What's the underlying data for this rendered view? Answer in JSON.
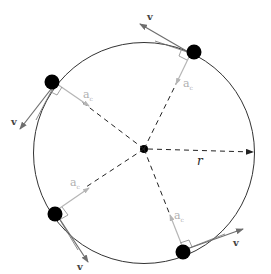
{
  "diagram": {
    "colors": {
      "circle": "#333333",
      "ball": "#000000",
      "velocity_arrow": "#6e6e6e",
      "acceleration_arrow": "#b5b5b5",
      "radius_dash": "#222222",
      "label_v": "#444444",
      "label_a": "#b0b0b0"
    },
    "center": {
      "x": 144,
      "y": 149
    },
    "radius": 110,
    "radius_label": "r",
    "velocity_label": "v",
    "acceleration_label": "a",
    "acceleration_subscript": "c",
    "objects": [
      {
        "id": "top-right",
        "velocity_label": "v",
        "acceleration_label": "a",
        "acceleration_subscript": "c"
      },
      {
        "id": "upper-left",
        "velocity_label": "v",
        "acceleration_label": "a",
        "acceleration_subscript": "c"
      },
      {
        "id": "lower-left",
        "velocity_label": "v",
        "acceleration_label": "a",
        "acceleration_subscript": "c"
      },
      {
        "id": "bottom-right",
        "velocity_label": "v",
        "acceleration_label": "a",
        "acceleration_subscript": "c"
      }
    ]
  }
}
